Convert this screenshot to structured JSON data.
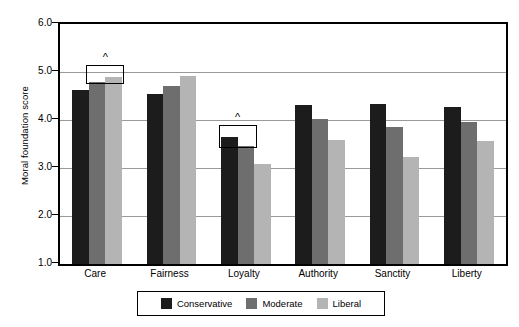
{
  "chart_data": {
    "type": "bar",
    "title": "",
    "subtitle": "",
    "xlabel": "",
    "ylabel": "Moral foundation score",
    "ylim": [
      1.0,
      6.0
    ],
    "ytick_labels": [
      "6.0",
      "5.0",
      "4.0",
      "3.0",
      "2.0",
      "1.0"
    ],
    "ytick_values": [
      6.0,
      5.0,
      4.0,
      3.0,
      2.0,
      1.0
    ],
    "grid": true,
    "legend_position": "bottom",
    "categories": [
      "Care",
      "Fairness",
      "Loyalty",
      "Authority",
      "Sanctity",
      "Liberty"
    ],
    "series": [
      {
        "name": "Conservative",
        "color": "#1c1c1c",
        "values": [
          4.63,
          4.54,
          3.65,
          4.32,
          4.33,
          4.27
        ]
      },
      {
        "name": "Moderate",
        "color": "#6e6e6e",
        "values": [
          4.79,
          4.7,
          3.45,
          4.02,
          3.85,
          3.95
        ]
      },
      {
        "name": "Liberal",
        "color": "#b4b4b4",
        "values": [
          4.9,
          4.92,
          3.08,
          3.58,
          3.22,
          3.56
        ]
      }
    ],
    "annotations": [
      {
        "label": "^",
        "category": "Care",
        "spans_series": [
          "Moderate",
          "Liberal"
        ]
      },
      {
        "label": "^",
        "category": "Loyalty",
        "spans_series": [
          "Conservative",
          "Moderate"
        ]
      }
    ]
  },
  "legend": {
    "entries": [
      {
        "label": "Conservative",
        "color": "#1c1c1c"
      },
      {
        "label": "Moderate",
        "color": "#6e6e6e"
      },
      {
        "label": "Liberal",
        "color": "#b4b4b4"
      }
    ]
  }
}
